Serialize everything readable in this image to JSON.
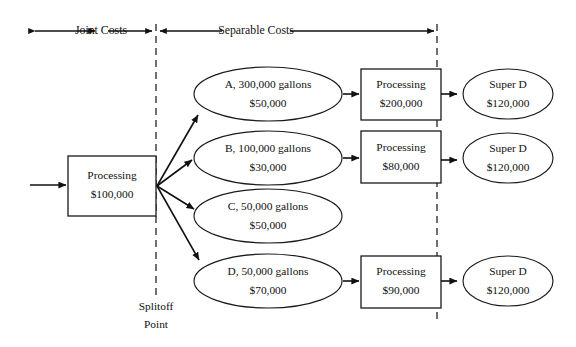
{
  "diagram": {
    "title_left": "Joint Costs",
    "title_right": "Separable Costs",
    "splitoff_line1": "Splitoff",
    "splitoff_line2": "Point",
    "colors": {
      "stroke": "#111111",
      "dashed": "#333333",
      "background": "#ffffff"
    }
  },
  "joint_process": {
    "label": "Processing",
    "amount": "$100,000"
  },
  "products": [
    {
      "id": "A",
      "label": "A, 300,000 gallons",
      "amount": "$50,000"
    },
    {
      "id": "B",
      "label": "B, 100,000 gallons",
      "amount": "$30,000"
    },
    {
      "id": "C",
      "label": "C, 50,000 gallons",
      "amount": "$50,000"
    },
    {
      "id": "D",
      "label": "D, 50,000 gallons",
      "amount": "$70,000"
    }
  ],
  "separable_processes": [
    {
      "for": "A",
      "label": "Processing",
      "amount": "$200,000"
    },
    {
      "for": "B",
      "label": "Processing",
      "amount": "$80,000"
    },
    {
      "for": "D",
      "label": "Processing",
      "amount": "$90,000"
    }
  ],
  "final_products": [
    {
      "for": "A",
      "label": "Super D",
      "amount": "$120,000"
    },
    {
      "for": "B",
      "label": "Super D",
      "amount": "$120,000"
    },
    {
      "for": "D",
      "label": "Super D",
      "amount": "$120,000"
    }
  ]
}
